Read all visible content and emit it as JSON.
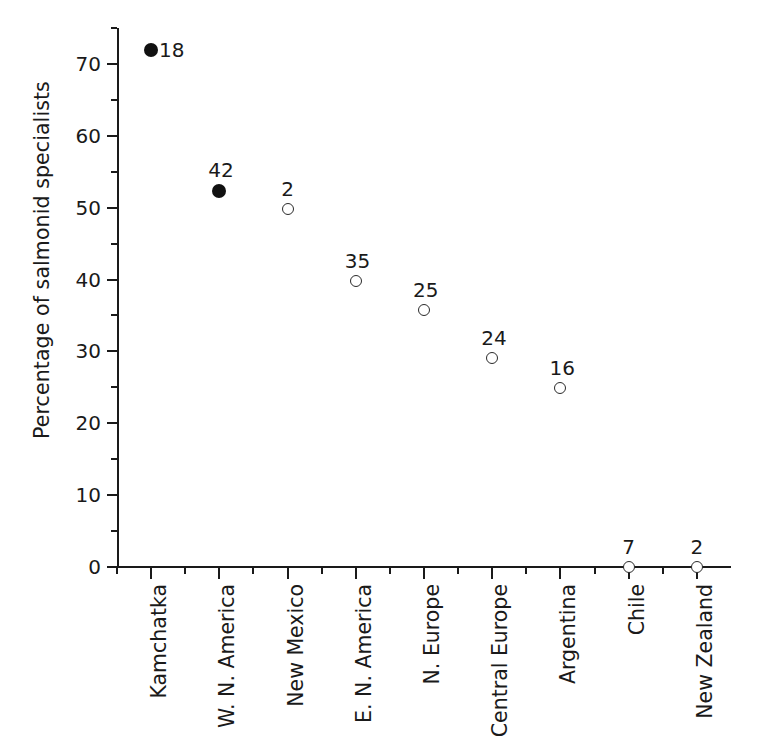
{
  "chart_data": {
    "type": "scatter",
    "title": "",
    "xlabel": "",
    "ylabel": "Percentage of salmonid specialists",
    "ylim": [
      0,
      75
    ],
    "ytick_values": [
      0,
      10,
      20,
      30,
      40,
      50,
      60,
      70
    ],
    "ytick_labels": [
      "0",
      "10",
      "20",
      "30",
      "40",
      "50",
      "60",
      "70"
    ],
    "yminor_values": [
      5,
      15,
      25,
      35,
      45,
      55,
      65,
      75
    ],
    "grid": false,
    "legend": "none",
    "categories": [
      "Kamchatka",
      "W. N. America",
      "New Mexico",
      "E. N. America",
      "N. Europe",
      "Central Europe",
      "Argentina",
      "Chile",
      "New Zealand"
    ],
    "values": [
      72.0,
      52.3,
      49.8,
      39.8,
      35.7,
      29.1,
      24.9,
      0.0,
      0.0
    ],
    "point_labels": [
      "18",
      "42",
      "2",
      "35",
      "25",
      "24",
      "16",
      "7",
      "2"
    ],
    "marker_styles": [
      "filled",
      "filled",
      "open",
      "open",
      "open",
      "open",
      "open",
      "open",
      "open"
    ],
    "label_positions": [
      "right",
      "above",
      "above",
      "above",
      "above",
      "above",
      "above",
      "above",
      "above"
    ],
    "colors": {
      "axis": "#1a1a1a",
      "filled_marker": "#111111",
      "open_marker_edge": "#2b2b2b",
      "open_marker_face": "#ffffff",
      "text": "#1a1a1a",
      "background": "#ffffff"
    }
  }
}
